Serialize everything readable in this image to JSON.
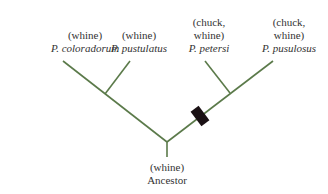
{
  "diagram": {
    "type": "phylogenetic-tree",
    "line_color": "#5b7a4a",
    "marker_color": "#1a1114",
    "taxa": [
      {
        "call": "(whine)",
        "species": "P. coloradorum"
      },
      {
        "call": "(whine)",
        "species": "P. pustulatus"
      },
      {
        "call_line1": "(chuck,",
        "call_line2": "whine)",
        "species": "P. petersi"
      },
      {
        "call_line1": "(chuck,",
        "call_line2": "whine)",
        "species": "P. pusulosus"
      }
    ],
    "root": {
      "call": "(whine)",
      "name": "Ancestor"
    },
    "marker": {
      "meaning": "origin of chuck call"
    }
  }
}
